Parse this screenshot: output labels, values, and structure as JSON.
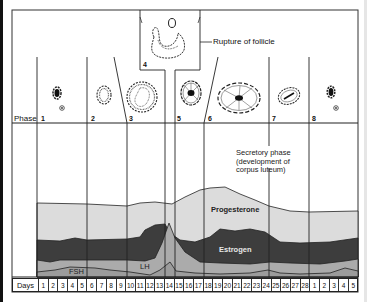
{
  "diagram": {
    "title_annotation": "Rupture of follicle",
    "phase_row_label": "Phase",
    "phases": [
      {
        "number": "1",
        "x": 41
      },
      {
        "number": "2",
        "x": 91
      },
      {
        "number": "3",
        "x": 129
      },
      {
        "number": "4",
        "x": 168
      },
      {
        "number": "5",
        "x": 177
      },
      {
        "number": "6",
        "x": 208
      },
      {
        "number": "7",
        "x": 272
      },
      {
        "number": "8",
        "x": 312
      }
    ],
    "secretory_note": {
      "line1": "Secretory phase",
      "line2": "(development of",
      "line3": "corpus luteum)"
    },
    "hormone_labels": {
      "progesterone": "Progesterone",
      "estrogen": "Estrogen",
      "lh": "LH",
      "fsh": "FSH"
    },
    "days_label": "Days",
    "days": [
      "1",
      "2",
      "3",
      "4",
      "5",
      "6",
      "7",
      "8",
      "9",
      "10",
      "11",
      "12",
      "13",
      "14",
      "15",
      "16",
      "17",
      "18",
      "19",
      "20",
      "21",
      "22",
      "23",
      "24",
      "25",
      "26",
      "27",
      "28",
      "1",
      "2",
      "3",
      "4",
      "5"
    ],
    "colors": {
      "progesterone": "#d9d9d9",
      "estrogen": "#3a3a3a",
      "lh": "#a9a9a9",
      "fsh": "#9a9a9a",
      "line": "#222222"
    }
  }
}
